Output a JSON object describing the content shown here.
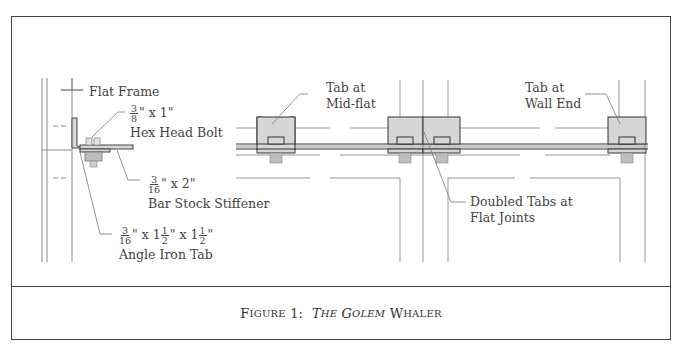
{
  "figure": {
    "caption": {
      "prefix_initial": "F",
      "prefix_rest": "igure",
      "number": "1:",
      "title_italic_initial_1": "T",
      "title_italic_rest_1": "he",
      "title_italic_initial_2": "G",
      "title_italic_rest_2": "olem",
      "title_plain_initial": "W",
      "title_plain_rest": "haler"
    },
    "labels": {
      "flat_frame": "Flat Frame",
      "bolt": {
        "num": "3",
        "den": "8",
        "rest": "\" x 1\"",
        "name": "Hex Head Bolt"
      },
      "stiffener": {
        "num": "3",
        "den": "16",
        "rest": "\" x 2\"",
        "name": "Bar Stock Stiffener"
      },
      "angle_tab": {
        "num": "3",
        "den": "16",
        "x1": "\" x 1",
        "f1_num": "1",
        "f1_den": "2",
        "x2": "\" x 1",
        "f2_num": "1",
        "f2_den": "2",
        "end": "\"",
        "name": "Angle Iron Tab"
      },
      "tab_mid_flat_line1": "Tab at",
      "tab_mid_flat_line2": "Mid-flat",
      "tab_wall_end_line1": "Tab at",
      "tab_wall_end_line2": "Wall End",
      "doubled_tabs_line1": "Doubled Tabs at",
      "doubled_tabs_line2": "Flat Joints"
    },
    "colors": {
      "line": "#444444",
      "light_line": "#8a8a8a",
      "tab_fill": "#d6d6d6",
      "bolt_fill": "#bdbdbd"
    }
  }
}
